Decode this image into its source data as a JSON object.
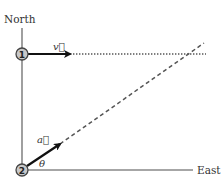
{
  "diagram": {
    "axes": {
      "north_label": "North",
      "east_label": "East"
    },
    "points": [
      {
        "id": "point-1",
        "label": "1"
      },
      {
        "id": "point-2",
        "label": "2"
      }
    ],
    "vectors": [
      {
        "id": "velocity",
        "label": "v⃗",
        "direction": "east"
      },
      {
        "id": "acceleration",
        "label": "a⃗",
        "direction": "northeast"
      }
    ],
    "angle_label": "θ",
    "lines": {
      "velocity_path": "dotted",
      "acceleration_path": "dashed"
    },
    "colors": {
      "axis": "#888888",
      "arrow": "#111111",
      "dotted": "#555555",
      "dashed": "#555555",
      "circle_fill": "#c8c8c8"
    }
  }
}
